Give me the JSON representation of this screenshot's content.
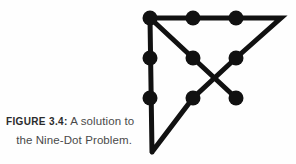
{
  "figure": {
    "caption_label": "FIGURE 3.4:",
    "caption_line1_rest": " A solution to",
    "caption_line2": "the Nine-Dot Problem.",
    "stroke_color": "#111111",
    "dot_color": "#111111",
    "background_color": "#fefefe",
    "stroke_width": 5,
    "dot_radius": 7.5,
    "dots": [
      {
        "name": "dot-r1c1",
        "x": 150,
        "y": 18
      },
      {
        "name": "dot-r1c2",
        "x": 193,
        "y": 18
      },
      {
        "name": "dot-r1c3",
        "x": 236,
        "y": 18
      },
      {
        "name": "dot-r2c1",
        "x": 150,
        "y": 58
      },
      {
        "name": "dot-r2c2",
        "x": 193,
        "y": 58
      },
      {
        "name": "dot-r2c3",
        "x": 236,
        "y": 58
      },
      {
        "name": "dot-r3c1",
        "x": 150,
        "y": 98
      },
      {
        "name": "dot-r3c2",
        "x": 193,
        "y": 98
      },
      {
        "name": "dot-r3c3",
        "x": 236,
        "y": 98
      }
    ],
    "path_points": [
      {
        "x": 152,
        "y": 152
      },
      {
        "x": 150,
        "y": 18
      },
      {
        "x": 281,
        "y": 18
      },
      {
        "x": 236,
        "y": 58
      },
      {
        "x": 193,
        "y": 98
      },
      {
        "x": 152,
        "y": 152
      }
    ],
    "diagonal_points": [
      {
        "x": 150,
        "y": 18
      },
      {
        "x": 193,
        "y": 58
      },
      {
        "x": 236,
        "y": 98
      }
    ]
  }
}
